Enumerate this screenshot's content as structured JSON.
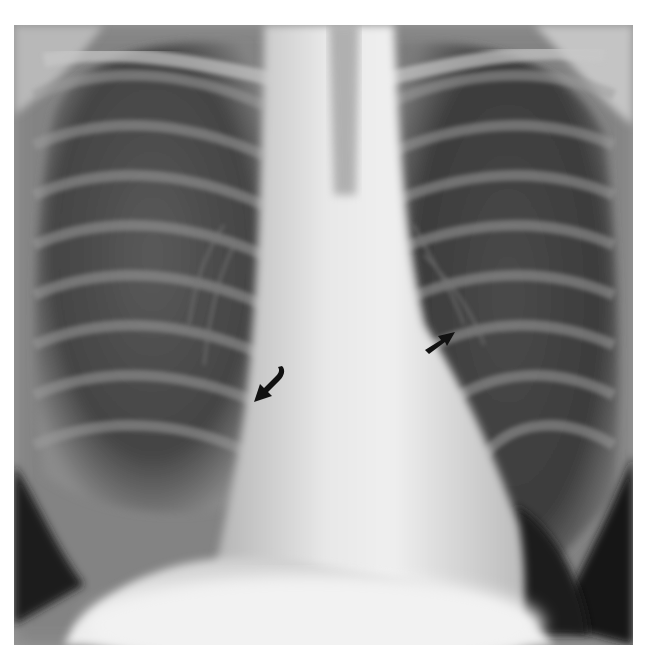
{
  "image": {
    "subject": "chest radiograph (PA view)",
    "annotations": [
      {
        "id": "arrow-right-hilum",
        "direction": "down-left",
        "x": 260,
        "y": 385
      },
      {
        "id": "arrow-left-heart-border",
        "direction": "up-right",
        "x": 435,
        "y": 338
      }
    ],
    "colors": {
      "background": "#ffffff",
      "lung": "#3a3a3a",
      "mediastinum": "#e6e6e6",
      "arrow": "#111111"
    }
  }
}
